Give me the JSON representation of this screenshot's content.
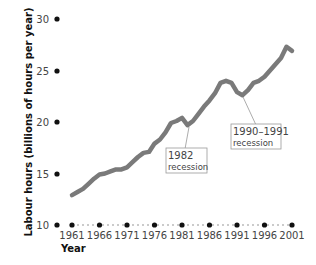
{
  "chart_data": {
    "type": "line",
    "title": "",
    "xlabel": "Year",
    "ylabel": "Labour hours (billions of hours per year)",
    "ylim": [
      10,
      30
    ],
    "xlim": [
      1961,
      2001
    ],
    "yticks": [
      10,
      15,
      20,
      25,
      30
    ],
    "xticks": [
      1961,
      1966,
      1971,
      1976,
      1981,
      1986,
      1991,
      1996,
      2001
    ],
    "grid": false,
    "legend": null,
    "series": [
      {
        "name": "Labour hours",
        "color": "#7a7a7a",
        "x": [
          1961,
          1962,
          1963,
          1964,
          1965,
          1966,
          1967,
          1968,
          1969,
          1970,
          1971,
          1972,
          1973,
          1974,
          1975,
          1976,
          1977,
          1978,
          1979,
          1980,
          1981,
          1982,
          1983,
          1984,
          1985,
          1986,
          1987,
          1988,
          1989,
          1990,
          1991,
          1992,
          1993,
          1994,
          1995,
          1996,
          1997,
          1998,
          1999,
          2000,
          2001
        ],
        "values": [
          12.9,
          13.2,
          13.5,
          14.0,
          14.5,
          14.9,
          15.0,
          15.2,
          15.4,
          15.4,
          15.6,
          16.1,
          16.6,
          17.0,
          17.1,
          17.9,
          18.3,
          19.0,
          19.9,
          20.1,
          20.4,
          19.7,
          20.1,
          20.8,
          21.5,
          22.1,
          22.8,
          23.8,
          24.0,
          23.8,
          22.9,
          22.6,
          23.1,
          23.8,
          24.0,
          24.4,
          25.0,
          25.6,
          26.2,
          27.3,
          26.9
        ]
      }
    ],
    "annotations": [
      {
        "label_line1": "1982",
        "label_line2": "recession",
        "x": 1982,
        "y": 19.7
      },
      {
        "label_line1": "1990–1991",
        "label_line2": "recession",
        "x": 1992,
        "y": 22.6
      }
    ]
  }
}
